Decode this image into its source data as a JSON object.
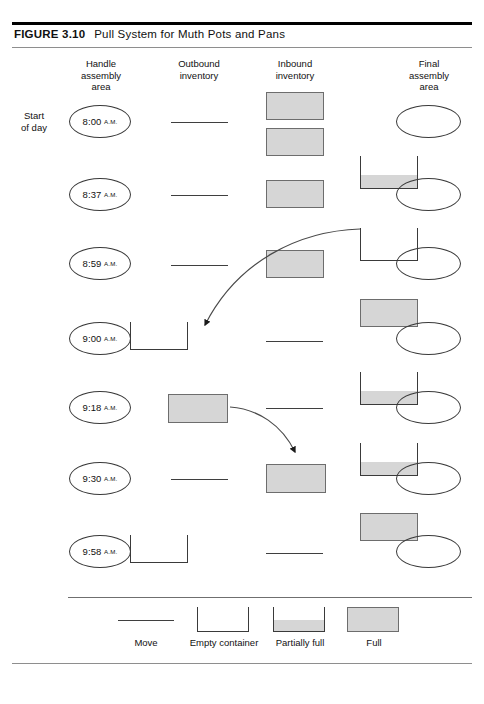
{
  "figure": {
    "label": "FIGURE 3.10",
    "caption": "Pull System for Muth Pots and Pans"
  },
  "columns": [
    {
      "id": "handle",
      "title": "Handle\nassembly\narea",
      "x": 62,
      "width": 78
    },
    {
      "id": "outbound",
      "title": "Outbound\ninventory",
      "x": 160,
      "width": 78
    },
    {
      "id": "inbound",
      "title": "Inbound\ninventory",
      "x": 256,
      "width": 78
    },
    {
      "id": "final",
      "title": "Final\nassembly\narea",
      "x": 390,
      "width": 78
    }
  ],
  "row_labels": [
    {
      "text": "Start\nof day",
      "x": 13,
      "y": 110
    }
  ],
  "rows": [
    {
      "time": "8:00",
      "ampm": "A.M."
    },
    {
      "time": "8:37",
      "ampm": "A.M."
    },
    {
      "time": "8:59",
      "ampm": "A.M."
    },
    {
      "time": "9:00",
      "ampm": "A.M."
    },
    {
      "time": "9:18",
      "ampm": "A.M."
    },
    {
      "time": "9:30",
      "ampm": "A.M."
    },
    {
      "time": "9:58",
      "ampm": "A.M."
    }
  ],
  "legend": {
    "items": [
      {
        "kind": "move",
        "label": "Move"
      },
      {
        "kind": "empty",
        "label": "Empty container"
      },
      {
        "kind": "partial",
        "label": "Partially full"
      },
      {
        "kind": "full",
        "label": "Full"
      }
    ]
  },
  "colors": {
    "container_fill": "#d6d6d6",
    "container_stroke": "#3a3a3a",
    "full_stroke": "#6d6d6d",
    "line": "#3f3f3f",
    "rule_dark": "#000000",
    "rule_light": "#8e8e8e",
    "text": "#111111"
  },
  "arrows": [
    {
      "id": "final-to-handle",
      "label": "empty container returned from final assembly to handle assembly"
    },
    {
      "id": "outbound-to-inbound",
      "label": "full container moved from outbound inventory to inbound inventory"
    }
  ]
}
